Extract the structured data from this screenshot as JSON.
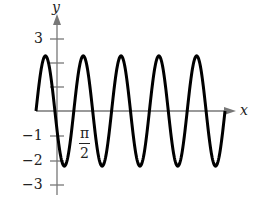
{
  "chart_data": {
    "type": "line",
    "title": "",
    "xlabel": "x",
    "ylabel": "y",
    "function": "y = 2.25 sin(x)-like oscillation, 5 full periods",
    "ylim": [
      -3,
      3
    ],
    "y_ticks": [
      3,
      2,
      1,
      -1,
      -2,
      -3
    ],
    "y_tick_labels": [
      "3",
      "",
      "",
      "-1",
      "-2",
      "-3"
    ],
    "x_tick_labels": [
      "π/2"
    ],
    "amplitude": 2.25,
    "periods": 5,
    "grid": false
  },
  "labels": {
    "y_axis": "y",
    "x_axis": "x",
    "y3": "3",
    "ym1": "−1",
    "ym2": "−2",
    "ym3": "−3",
    "pi_num": "π",
    "pi_den": "2"
  }
}
